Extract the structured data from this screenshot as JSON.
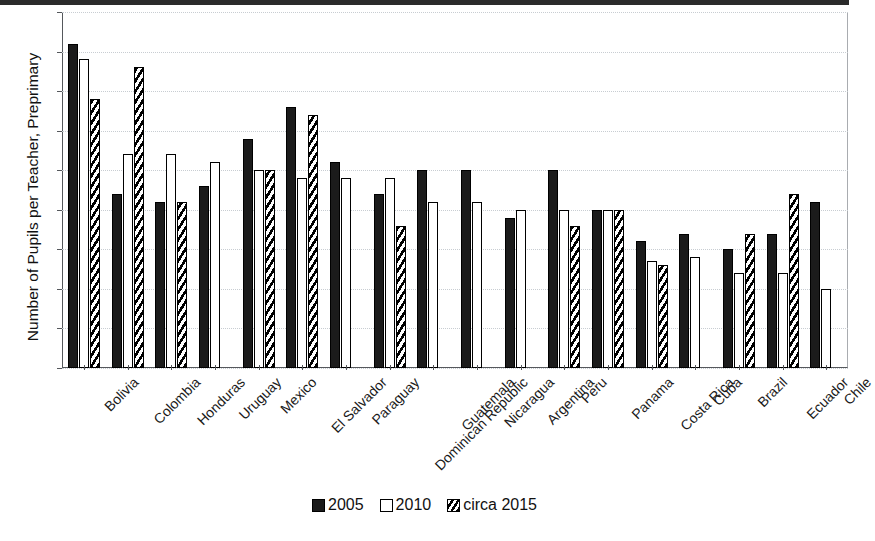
{
  "chart_data": {
    "type": "bar",
    "title": "",
    "xlabel": "",
    "ylabel": "Number of Pupils per Teacher, Preprimary",
    "ylim": [
      0,
      45
    ],
    "ytick_step": 5,
    "yticks": [
      45,
      40,
      35,
      30,
      25,
      20,
      15,
      10,
      5,
      0
    ],
    "grid": true,
    "legend_position": "bottom-center",
    "categories": [
      "Bolivia",
      "Colombia",
      "Honduras",
      "Uruguay",
      "Mexico",
      "El Salvador",
      "Paraguay",
      "Dominican Republic",
      "Guatemala",
      "Nicaragua",
      "Argentina",
      "Peru",
      "Panama",
      "Costa Rica",
      "Cuba",
      "Brazil",
      "Ecuador",
      "Chile"
    ],
    "series": [
      {
        "name": "2005",
        "style": "solid-black",
        "color": "#1b1b1b",
        "values": [
          41,
          22,
          21,
          23,
          29,
          33,
          26,
          22,
          25,
          25,
          19,
          25,
          20,
          16,
          17,
          15,
          17,
          21
        ]
      },
      {
        "name": "2010",
        "style": "white-outline",
        "color": "#ffffff",
        "values": [
          39,
          27,
          27,
          26,
          25,
          24,
          24,
          24,
          21,
          21,
          20,
          20,
          20,
          13.5,
          14,
          12,
          12,
          10
        ]
      },
      {
        "name": "circa 2015",
        "style": "hatched",
        "color": "#000000",
        "values": [
          34,
          38,
          21,
          null,
          25,
          32,
          null,
          18,
          null,
          null,
          null,
          18,
          20,
          13,
          null,
          17,
          22,
          null
        ]
      }
    ]
  },
  "legend": {
    "items": [
      {
        "label": "2005"
      },
      {
        "label": "2010"
      },
      {
        "label": "circa 2015"
      }
    ]
  }
}
